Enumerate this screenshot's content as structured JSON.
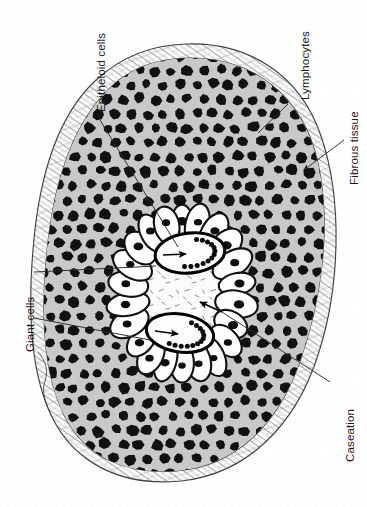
{
  "figure": {
    "type": "medical-illustration",
    "background_color": "#ffffff",
    "ink_color": "#1a1a1a"
  },
  "colors": {
    "lymphocyte_zone_fill": "#c9c9c9",
    "lymphocyte_nucleus": "#121212",
    "fibrous_capsule_fill": "#fdfdfd",
    "fibrous_capsule_stroke": "#4a4a4a",
    "caseation_fill": "#fbfbfb",
    "caseation_debris": "#6f6f6f",
    "epithelioid_fill": "#ffffff",
    "epithelioid_stroke": "#111111",
    "giant_cell_fill": "#fdfdfd",
    "giant_cell_stroke": "#000000",
    "leader_line": "#2b2b2b",
    "label_text": "#1b1b1b"
  },
  "labels": [
    {
      "id": "epitheloid-cells",
      "text": "Epitheloid cells",
      "orientation": "vertical-bottom-to-top",
      "position": {
        "x": 96,
        "y": 112
      },
      "leader": "line-from-label-to-epithelioid-cell-ring"
    },
    {
      "id": "lymphocytes",
      "text": "Lymphocytes",
      "orientation": "vertical-bottom-to-top",
      "position": {
        "x": 300,
        "y": 100
      },
      "leader": "line-from-label-to-lymphocyte-zone"
    },
    {
      "id": "fibrous-tissue",
      "text": "Fibrous tissue",
      "orientation": "vertical-bottom-to-top",
      "position": {
        "x": 349,
        "y": 185
      },
      "leader": "arrow-from-label-to-fibrous-capsule"
    },
    {
      "id": "giant-cells",
      "text": "Giant cells",
      "orientation": "vertical-bottom-to-top",
      "position": {
        "x": 25,
        "y": 352
      },
      "leader": "two-lines-from-label-to-upper-and-lower-giant-cells"
    },
    {
      "id": "caseation",
      "text": "Caseation",
      "orientation": "vertical-bottom-to-top",
      "position": {
        "x": 345,
        "y": 462
      },
      "leader": "line-from-label-to-central-caseous-necrosis"
    }
  ],
  "structures": [
    {
      "name": "fibrous-capsule",
      "description": "Outer wavy fibrous tissue band with hatched collagen texture enclosing the whole tubercle"
    },
    {
      "name": "lymphocyte-zone",
      "description": "Broad mid-grey zone densely packed with small dark round lymphocyte nuclei"
    },
    {
      "name": "epithelioid-cell-ring",
      "description": "Palisade ring of elongated pale epithelioid cells with single oval nuclei surrounding the centre"
    },
    {
      "name": "giant-cell-upper",
      "description": "Langhans multinucleated giant cell with horseshoe arrangement of peripheral nuclei"
    },
    {
      "name": "giant-cell-lower",
      "description": "Second Langhans multinucleated giant cell with horseshoe arrangement of peripheral nuclei"
    },
    {
      "name": "caseation-zone",
      "description": "Central pale amorphous caseous necrosis with scattered granular debris"
    }
  ],
  "annotation_arrows": [
    {
      "id": "arrow-giant-cell-upper",
      "points_to": "giant-cell-upper"
    },
    {
      "id": "arrow-giant-cell-lower",
      "points_to": "giant-cell-lower"
    },
    {
      "id": "arrow-caseation",
      "points_to": "caseation-zone"
    },
    {
      "id": "arrow-fibrous-tissue",
      "points_to": "fibrous-capsule"
    }
  ]
}
